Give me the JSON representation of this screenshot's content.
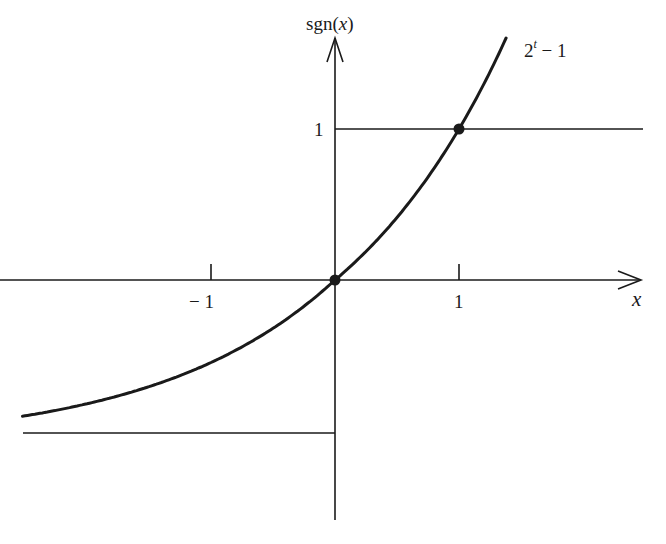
{
  "chart_data": {
    "type": "line",
    "title": "",
    "xlabel": "x",
    "ylabel": "sgn(x)",
    "x_ticks": [
      {
        "value": -1,
        "label": "− 1"
      },
      {
        "value": 1,
        "label": "1"
      }
    ],
    "y_ticks": [
      {
        "value": 1,
        "label": "1"
      }
    ],
    "xlim": [
      -2.52,
      2.46
    ],
    "ylim": [
      -1.6,
      1.6
    ],
    "grid": false,
    "series": [
      {
        "name": "sgn(x)",
        "style": "step",
        "segments": [
          {
            "x": [
              -2.52,
              0
            ],
            "y": [
              -1,
              -1
            ]
          },
          {
            "x": [
              0,
              2.46
            ],
            "y": [
              1,
              1
            ]
          }
        ]
      },
      {
        "name": "2^t − 1",
        "style": "curve",
        "formula": "2^t - 1",
        "x": [
          -2.52,
          -2,
          -1.5,
          -1,
          -0.5,
          0,
          0.5,
          1,
          1.38
        ],
        "y": [
          -0.83,
          -0.75,
          -0.65,
          -0.5,
          -0.29,
          0,
          0.41,
          1,
          1.6
        ]
      }
    ],
    "points": [
      {
        "x": 0,
        "y": 0
      },
      {
        "x": 1,
        "y": 1
      }
    ],
    "annotations": [
      {
        "text": "2",
        "superscript": "t",
        "suffix": " − 1",
        "near": "curve-top-right"
      }
    ]
  },
  "labels": {
    "y_axis": "sgn(",
    "y_axis_var": "x",
    "y_axis_close": ")",
    "x_axis": "x",
    "curve_base": "2",
    "curve_exp": "t",
    "curve_suffix": " − 1",
    "tick_neg1": "− 1",
    "tick_pos1": "1",
    "ytick_1": "1"
  },
  "colors": {
    "ink": "#1a1a1a",
    "background": "#ffffff"
  }
}
